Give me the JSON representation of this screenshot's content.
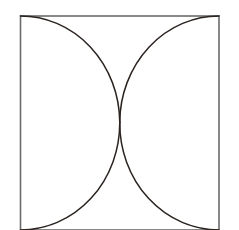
{
  "figure": {
    "background_color": "#ffffff",
    "petal_fill_color": "#ee7a58",
    "petal_stroke_color": "#2b2320",
    "square_stroke_color": "#6b6b6b",
    "square_stroke_width": 1.6,
    "petal_stroke_width": 1.5
  },
  "geometry": {
    "square": {
      "label": "bounding-square",
      "x": 20.5,
      "y": 16.0,
      "width": 198.5,
      "height": 214.0,
      "side": 198.5,
      "corners": [
        {
          "name": "top-left",
          "x": 20.5,
          "y": 16.0
        },
        {
          "name": "top-right",
          "x": 219.0,
          "y": 16.0
        },
        {
          "name": "bottom-right",
          "x": 219.0,
          "y": 230.0
        },
        {
          "name": "bottom-left",
          "x": 20.5,
          "y": 230.0
        }
      ]
    },
    "center": {
      "x": 119.75,
      "y": 122.0
    },
    "semicircle_radius": 99.25,
    "semicircle_centers": [
      {
        "name": "top-midpoint",
        "x": 119.75,
        "y": 16.0
      },
      {
        "name": "right-midpoint",
        "x": 219.0,
        "y": 122.0
      },
      {
        "name": "bottom-midpoint",
        "x": 119.75,
        "y": 230.0
      },
      {
        "name": "left-midpoint",
        "x": 20.5,
        "y": 122.0
      }
    ],
    "petals": [
      {
        "name": "petal-top-left",
        "tip_corner": "top-left",
        "tip_x": 20.5,
        "tip_y": 16.0,
        "path": "M 20.5 16.0 A 99.25 106 0 0 1 119.75 122.0 A 99.25 106 0 0 1 20.5 16.0 Z"
      },
      {
        "name": "petal-top-right",
        "tip_corner": "top-right",
        "tip_x": 219.0,
        "tip_y": 16.0,
        "path": "M 219.0 16.0 A 99.25 106 0 0 1 119.75 122.0 A 99.25 106 0 0 1 219.0 16.0 Z"
      },
      {
        "name": "petal-bottom-right",
        "tip_corner": "bottom-right",
        "tip_x": 219.0,
        "tip_y": 230.0,
        "path": "M 219.0 230.0 A 99.25 106 0 0 1 119.75 122.0 A 99.25 106 0 0 1 219.0 230.0 Z"
      },
      {
        "name": "petal-bottom-left",
        "tip_corner": "bottom-left",
        "tip_x": 20.5,
        "tip_y": 230.0,
        "path": "M 20.5 230.0 A 99.25 106 0 0 1 119.75 122.0 A 99.25 106 0 0 1 20.5 230.0 Z"
      }
    ]
  }
}
